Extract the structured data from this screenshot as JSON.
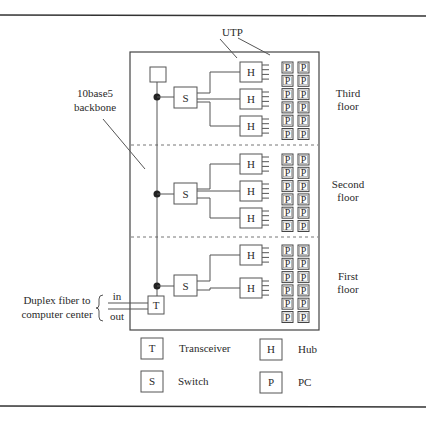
{
  "diagram": {
    "labels": {
      "utp": "UTP",
      "backbone_line1": "10base5",
      "backbone_line2": "backbone",
      "fiber_line1": "Duplex fiber to",
      "fiber_line2": "computer center",
      "fiber_in": "in",
      "fiber_out": "out"
    },
    "floors": [
      {
        "name_line1": "Third",
        "name_line2": "floor",
        "switch": "S",
        "hubs": [
          "H",
          "H",
          "H"
        ],
        "pcs_per_column": 6,
        "pc_label": "P"
      },
      {
        "name_line1": "Second",
        "name_line2": "floor",
        "switch": "S",
        "hubs": [
          "H",
          "H",
          "H"
        ],
        "pcs_per_column": 6,
        "pc_label": "P"
      },
      {
        "name_line1": "First",
        "name_line2": "floor",
        "switch": "S",
        "hubs": [
          "H",
          "H"
        ],
        "pcs_per_column": 6,
        "pc_label": "P"
      }
    ],
    "transceiver_box": "T",
    "legend": [
      {
        "symbol": "T",
        "text": "Transceiver"
      },
      {
        "symbol": "H",
        "text": "Hub"
      },
      {
        "symbol": "S",
        "text": "Switch"
      },
      {
        "symbol": "P",
        "text": "PC"
      }
    ]
  }
}
